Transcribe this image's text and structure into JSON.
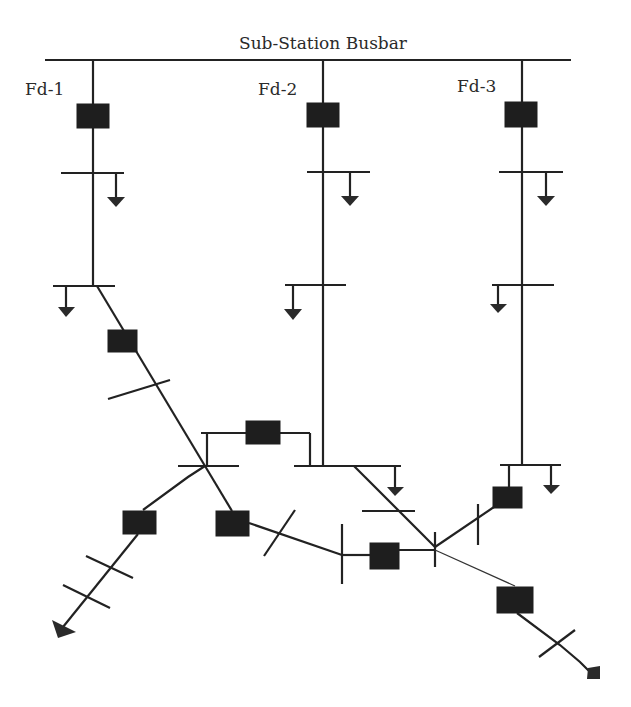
{
  "diagram": {
    "title": "Sub-Station Busbar",
    "feeders": [
      {
        "id": "fd1",
        "label": "Fd-1"
      },
      {
        "id": "fd2",
        "label": "Fd-2"
      },
      {
        "id": "fd3",
        "label": "Fd-3"
      }
    ],
    "colors": {
      "line": "#222222",
      "breaker": "#1e1e1e",
      "background": "#ffffff"
    },
    "symbols": {
      "breaker": "filled-rectangle",
      "load": "down-arrow",
      "bus": "horizontal-bar",
      "section": "cross-tick",
      "feeder_end": "arrow-head"
    }
  }
}
